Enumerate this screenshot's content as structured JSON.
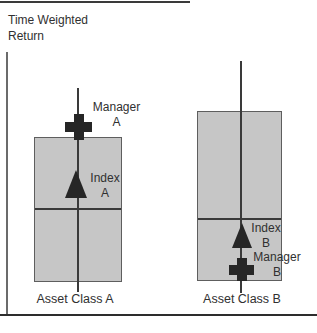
{
  "figure": {
    "title_line1": "Time Weighted",
    "title_line2": "Return"
  },
  "groups": [
    {
      "axis_label": "Asset Class A",
      "manager_marker": {
        "shape": "plus-cross",
        "line1": "Manager",
        "line2": "A"
      },
      "index_marker": {
        "shape": "triangle-up",
        "line1": "Index",
        "line2": "A"
      }
    },
    {
      "axis_label": "Asset Class B",
      "manager_marker": {
        "shape": "plus-cross",
        "line1": "Manager",
        "line2": "B"
      },
      "index_marker": {
        "shape": "triangle-up",
        "line1": "Index",
        "line2": "B"
      }
    }
  ],
  "colors": {
    "box_fill": "#c6c6c6",
    "box_border": "#5e5e5e",
    "line": "#3a3a3a",
    "marker": "#262626",
    "axis_y": "#6b6b6b",
    "axis_x": "#2d2d2d",
    "rule": "#3a3a3a",
    "text": "#303030"
  }
}
